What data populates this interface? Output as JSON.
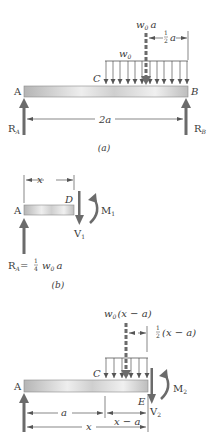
{
  "panels": {
    "a": {
      "caption": "(a)",
      "point_A": "A",
      "point_B": "B",
      "point_C": "C",
      "load_label": "w",
      "load_sub": "0",
      "resultant_label": "w",
      "resultant_sub": "0",
      "resultant_var": "a",
      "half_num": "1",
      "half_den": "2",
      "half_var": "a",
      "span_label": "2a",
      "reaction_A": "R",
      "reaction_A_sub": "A",
      "reaction_B": "R",
      "reaction_B_sub": "B"
    },
    "b": {
      "caption": "(b)",
      "point_A": "A",
      "point_D": "D",
      "length_label": "x",
      "shear": "V",
      "shear_sub": "1",
      "moment": "M",
      "moment_sub": "1",
      "reaction": "R",
      "reaction_sub": "A",
      "reaction_eq": "=",
      "frac_num": "1",
      "frac_den": "4",
      "reaction_w": "w",
      "reaction_w_sub": "0",
      "reaction_var": "a"
    },
    "c": {
      "point_A": "A",
      "point_C": "C",
      "point_E": "E",
      "resultant_w": "w",
      "resultant_sub": "0",
      "resultant_expr": "(x − a)",
      "half_num": "1",
      "half_den": "2",
      "half_expr": "(x − a)",
      "dim_a": "a",
      "dim_x_minus_a": "x − a",
      "dim_x": "x",
      "shear": "V",
      "shear_sub": "2",
      "moment": "M",
      "moment_sub": "2"
    }
  },
  "colors": {
    "beam_light": "#e8e8e8",
    "beam_dark": "#b8b8b8",
    "arrow": "#6b6b6b",
    "line": "#555555",
    "text": "#3a3a3a"
  }
}
